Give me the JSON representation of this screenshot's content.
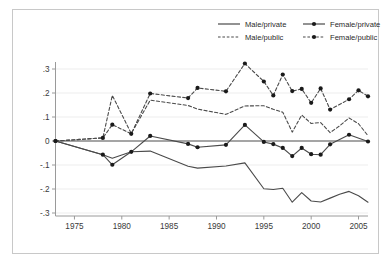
{
  "figure": {
    "background_color": "#ffffff",
    "frame_color": "#c8c8c8",
    "grid_color": "#ededed",
    "line_color": "#4a4a4a",
    "marker_color": "#1a1a1a"
  },
  "legend": {
    "position": "top-right",
    "entries": [
      {
        "label": "Male/private",
        "style": "solid",
        "markers": false
      },
      {
        "label": "Female/private",
        "style": "solid",
        "markers": true
      },
      {
        "label": "Male/public",
        "style": "dashed",
        "markers": false
      },
      {
        "label": "Female/public",
        "style": "dashed",
        "markers": true
      }
    ]
  },
  "chart_data": {
    "type": "line",
    "title": "",
    "xlabel": "",
    "ylabel": "",
    "xlim": [
      1973,
      2006
    ],
    "ylim": [
      -0.3,
      0.33
    ],
    "grid": true,
    "legend_position": "top-right",
    "xticks": [
      1975,
      1980,
      1985,
      1990,
      1995,
      2000,
      2005
    ],
    "xtick_labels": [
      "1975",
      "1980",
      "1985",
      "1990",
      "1995",
      "2000",
      "2005"
    ],
    "yticks": [
      0.3,
      0.2,
      0.1,
      0,
      -0.1,
      -0.2,
      -0.3
    ],
    "ytick_labels": [
      ".3",
      ".2",
      ".1",
      "0",
      "-.1",
      "-.2",
      "-.3"
    ],
    "series": [
      {
        "name": "Male/private",
        "style": "solid",
        "markers": false,
        "x": [
          1973,
          1978,
          1979,
          1981,
          1983,
          1987,
          1988,
          1991,
          1993,
          1995,
          1996,
          1997,
          1998,
          1999,
          2000,
          2001,
          2002,
          2003,
          2004,
          2005,
          2006
        ],
        "y": [
          0.0,
          -0.057,
          -0.072,
          -0.045,
          -0.042,
          -0.105,
          -0.113,
          -0.104,
          -0.091,
          -0.199,
          -0.202,
          -0.197,
          -0.255,
          -0.215,
          -0.25,
          -0.254,
          -0.238,
          -0.222,
          -0.21,
          -0.228,
          -0.255
        ]
      },
      {
        "name": "Female/private",
        "style": "solid",
        "markers": true,
        "x": [
          1973,
          1978,
          1979,
          1981,
          1983,
          1987,
          1988,
          1991,
          1993,
          1995,
          1996,
          1997,
          1998,
          1999,
          2000,
          2001,
          2002,
          2004,
          2006
        ],
        "y": [
          0.0,
          -0.057,
          -0.099,
          -0.045,
          0.021,
          -0.012,
          -0.026,
          -0.016,
          0.067,
          -0.004,
          -0.013,
          -0.029,
          -0.063,
          -0.029,
          -0.055,
          -0.057,
          -0.014,
          0.026,
          -0.002
        ]
      },
      {
        "name": "Male/public",
        "style": "dashed",
        "markers": false,
        "x": [
          1973,
          1978,
          1979,
          1981,
          1983,
          1987,
          1988,
          1991,
          1993,
          1995,
          1996,
          1997,
          1998,
          1999,
          2000,
          2001,
          2002,
          2003,
          2004,
          2005,
          2006
        ],
        "y": [
          0.0,
          0.013,
          0.19,
          0.031,
          0.17,
          0.148,
          0.133,
          0.111,
          0.146,
          0.147,
          0.132,
          0.12,
          0.037,
          0.108,
          0.073,
          0.077,
          0.035,
          0.063,
          0.096,
          0.072,
          0.022
        ]
      },
      {
        "name": "Female/public",
        "style": "dashed",
        "markers": true,
        "x": [
          1973,
          1978,
          1979,
          1981,
          1983,
          1987,
          1988,
          1991,
          1993,
          1995,
          1996,
          1997,
          1998,
          1999,
          2000,
          2001,
          2002,
          2004,
          2005,
          2006
        ],
        "y": [
          0.0,
          0.013,
          0.068,
          0.03,
          0.198,
          0.179,
          0.221,
          0.207,
          0.323,
          0.248,
          0.19,
          0.277,
          0.208,
          0.217,
          0.159,
          0.219,
          0.131,
          0.174,
          0.211,
          0.186
        ]
      }
    ]
  }
}
